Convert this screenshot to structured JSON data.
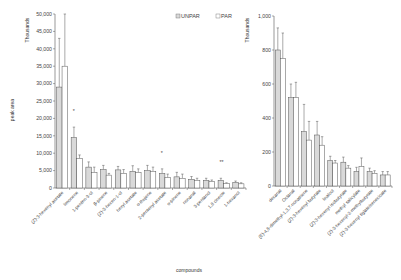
{
  "chart_data": [
    {
      "type": "bar",
      "title": "",
      "xlabel": "compounds",
      "ylabel": "peak area",
      "yunit": "Thousands",
      "ylim": [
        0,
        50000
      ],
      "yticks": [
        "0",
        "5,000",
        "10,000",
        "15,000",
        "20,000",
        "25,000",
        "30,000",
        "35,000",
        "40,000",
        "45,000",
        "50,000"
      ],
      "legend": [
        "UNPAR",
        "PAR"
      ],
      "categories": [
        "(Z)-3-hexenyl acetate",
        "limonene",
        "1-penten-3-ol",
        "β-pinene",
        "(Z)-3-hexen-1-ol",
        "hexyl acetate",
        "α-thujene",
        "2-pentenyl acetate",
        "α-pinene",
        "nonanal",
        "3-pentanol",
        "1,8 cineole",
        "1-hexanol"
      ],
      "series": [
        {
          "name": "UNPAR",
          "color": "#d9d9d9",
          "values": [
            29000,
            14500,
            6000,
            5300,
            5200,
            4800,
            5000,
            4200,
            3200,
            2500,
            2200,
            2200,
            1600
          ],
          "err_top": [
            43000,
            17500,
            7500,
            6500,
            6200,
            6400,
            6500,
            5500,
            4500,
            3300,
            2800,
            2800,
            2000
          ]
        },
        {
          "name": "PAR",
          "color": "#ffffff",
          "values": [
            35000,
            8500,
            4500,
            3700,
            4200,
            4500,
            4800,
            3000,
            2800,
            2200,
            1900,
            1300,
            1200
          ],
          "err_top": [
            50000,
            9500,
            6000,
            4200,
            5300,
            5500,
            6000,
            4000,
            4000,
            2800,
            2300,
            1500,
            1500
          ]
        }
      ],
      "annotations": [
        {
          "category": "limonene",
          "text": "*"
        },
        {
          "category": "2-pentenyl acetate",
          "text": "*"
        },
        {
          "category": "1,8 cineole",
          "text": "**"
        }
      ]
    },
    {
      "type": "bar",
      "title": "",
      "xlabel": "compounds",
      "ylabel": "peak area",
      "yunit": "Thousands",
      "ylim": [
        0,
        1000
      ],
      "yticks": [
        "0",
        "200",
        "400",
        "600",
        "800",
        "1,000"
      ],
      "legend": [
        "UNPAR",
        "PAR"
      ],
      "categories": [
        "decanal",
        "Octanal",
        "(E)-4,8-dimethyl-1,3,7-nonatriene",
        "(Z)-3-hexenyl butyrate",
        "linalool",
        "(Z)-3-hexenyl isobutyrate",
        "methyl salicylate",
        "(Z)-3-hexenyl-2-methylbutyrate",
        "(Z)-3-hexenyl tiglate/senecioate"
      ],
      "series": [
        {
          "name": "UNPAR",
          "color": "#d9d9d9",
          "values": [
            800,
            520,
            320,
            300,
            150,
            140,
            85,
            85,
            65
          ],
          "err_top": [
            930,
            600,
            480,
            380,
            175,
            170,
            110,
            105,
            85
          ]
        },
        {
          "name": "PAR",
          "color": "#ffffff",
          "values": [
            750,
            520,
            270,
            240,
            135,
            105,
            115,
            75,
            65
          ],
          "err_top": [
            900,
            610,
            380,
            290,
            150,
            120,
            165,
            90,
            85
          ]
        }
      ]
    }
  ],
  "labels": {
    "xlabel": "compounds",
    "ylabel": "peak area",
    "unit_left": "Thousands",
    "unit_right": "Thousands",
    "legend_unpar": "UNPAR",
    "legend_par": "PAR"
  }
}
